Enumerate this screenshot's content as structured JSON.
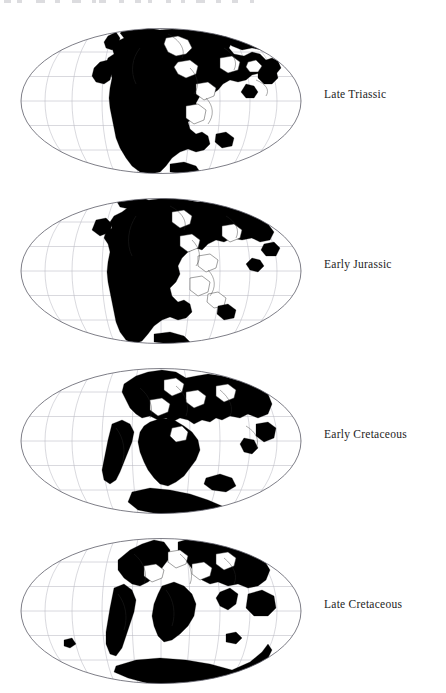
{
  "page": {
    "background_color": "#ffffff",
    "width": 446,
    "height": 693,
    "figure_type": "paleogeographic-map-series",
    "projection": "Mollweide",
    "land_color": "#000000",
    "ocean_color": "#ffffff",
    "graticule_color": "#b9b9c2",
    "outline_color": "#5d5d68",
    "label_color": "#1c1c1c"
  },
  "artifact": {
    "description": "faint clipped text descenders along the very top edge",
    "fragments": [
      {
        "x": 4,
        "w": 7
      },
      {
        "x": 17,
        "w": 5
      },
      {
        "x": 36,
        "w": 9
      },
      {
        "x": 55,
        "w": 5
      },
      {
        "x": 72,
        "w": 9
      },
      {
        "x": 92,
        "w": 4
      },
      {
        "x": 99,
        "w": 7
      },
      {
        "x": 119,
        "w": 5
      },
      {
        "x": 135,
        "w": 6
      },
      {
        "x": 148,
        "w": 4
      },
      {
        "x": 166,
        "w": 5
      },
      {
        "x": 181,
        "w": 4
      },
      {
        "x": 196,
        "w": 9
      },
      {
        "x": 216,
        "w": 5
      },
      {
        "x": 232,
        "w": 6
      },
      {
        "x": 250,
        "w": 4
      }
    ]
  },
  "maps": [
    {
      "id": "map-late-triassic",
      "label": "Late Triassic",
      "order": 1,
      "top": 28,
      "label_top": 88,
      "ellipse": {
        "cx": 141,
        "cy": 72.5,
        "rx": 140,
        "ry": 72.5
      },
      "graticule": {
        "meridian_interval_deg": 30,
        "parallel_interval_deg": 30
      },
      "notes": "Pangaea largely assembled; single supercontinent spanning the centre of the projection with the Tethys embayment open to the east."
    },
    {
      "id": "map-early-jurassic",
      "label": "Early Jurassic",
      "order": 2,
      "top": 198,
      "label_top": 258,
      "ellipse": {
        "cx": 141,
        "cy": 72.5,
        "rx": 140,
        "ry": 72.5
      },
      "graticule": {
        "meridian_interval_deg": 30,
        "parallel_interval_deg": 30
      },
      "notes": "Pangaea beginning to rift; incipient central Atlantic separation, Tethys widening."
    },
    {
      "id": "map-early-cretaceous",
      "label": "Early Cretaceous",
      "order": 3,
      "top": 368,
      "label_top": 428,
      "ellipse": {
        "cx": 141,
        "cy": 72.5,
        "rx": 140,
        "ry": 72.5
      },
      "graticule": {
        "meridian_interval_deg": 30,
        "parallel_interval_deg": 30
      },
      "notes": "Gondwana fragmenting; South Atlantic opening, Africa and South America separating."
    },
    {
      "id": "map-late-cretaceous",
      "label": "Late Cretaceous",
      "order": 4,
      "top": 538,
      "label_top": 598,
      "ellipse": {
        "cx": 141,
        "cy": 72.5,
        "rx": 140,
        "ry": 72.5
      },
      "graticule": {
        "meridian_interval_deg": 30,
        "parallel_interval_deg": 30
      },
      "notes": "Continents approaching modern configuration; wide Atlantic, India separate, Antarctica at the southern margin."
    }
  ]
}
